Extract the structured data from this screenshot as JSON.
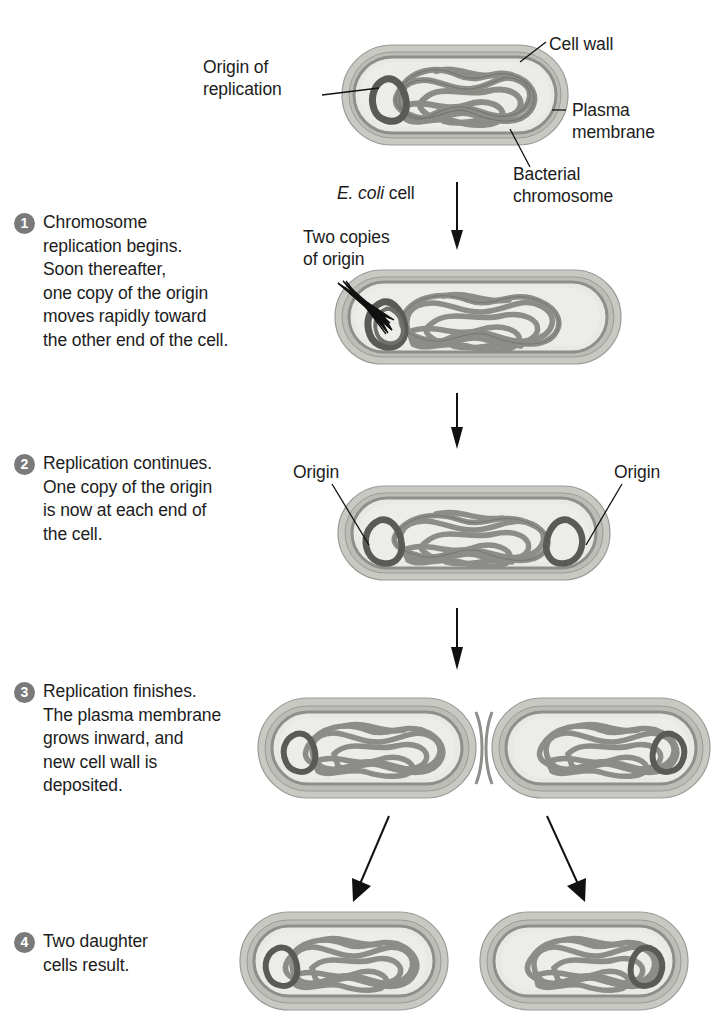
{
  "figure": {
    "organism_label_italic": "E. coli",
    "organism_label_rest": " cell"
  },
  "callouts": {
    "origin_of_replication": "Origin of\nreplication",
    "cell_wall": "Cell wall",
    "plasma_membrane": "Plasma\nmembrane",
    "bacterial_chromosome": "Bacterial\nchromosome",
    "two_copies_of_origin": "Two copies\nof origin",
    "origin_left": "Origin",
    "origin_right": "Origin"
  },
  "steps": [
    {
      "number": "1",
      "text": "Chromosome\nreplication begins.\nSoon thereafter,\none copy of the origin\nmoves rapidly toward\nthe other end of the cell."
    },
    {
      "number": "2",
      "text": "Replication continues.\nOne copy of the origin\nis now at each end of\nthe cell."
    },
    {
      "number": "3",
      "text": "Replication finishes.\nThe plasma membrane\ngrows inward, and\nnew cell wall is\ndeposited."
    },
    {
      "number": "4",
      "text": "Two daughter\ncells result."
    }
  ],
  "colors": {
    "background": "#ffffff",
    "text": "#1c1c1c",
    "step_badge_fill": "#7a7a7a",
    "step_badge_text": "#ffffff",
    "cell_wall_outer": "#c9c9c4",
    "cell_wall_band": "#a9a9a4",
    "plasma_membrane": "#8e8e8a",
    "cytoplasm": "#e6e6e2",
    "chromosome_strand": "#8c8c88",
    "chromosome_outline": "#6f6f6b",
    "origin_loop": "#5a5a57",
    "leader_line": "#111111",
    "arrow": "#111111"
  },
  "arrows": {
    "stage1_to_2": "down",
    "stage2_to_3": "down",
    "stage3_to_4_left": "down-left",
    "stage3_to_4_right": "down-right"
  },
  "stages": [
    {
      "name": "parent-cell",
      "caption": "E. coli cell"
    },
    {
      "name": "replication-begins-cell",
      "caption": ""
    },
    {
      "name": "replication-continues-cell",
      "caption": ""
    },
    {
      "name": "dividing-cell",
      "caption": ""
    },
    {
      "name": "daughter-cell-left",
      "caption": ""
    },
    {
      "name": "daughter-cell-right",
      "caption": ""
    }
  ]
}
